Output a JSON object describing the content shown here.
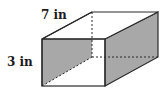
{
  "diagram": {
    "type": "rectangular-prism",
    "labels": {
      "depth": "7 in",
      "height": "3 in"
    },
    "colors": {
      "stroke": "#2a2a2a",
      "shade": "#a8a8a8",
      "background": "#ffffff"
    }
  }
}
